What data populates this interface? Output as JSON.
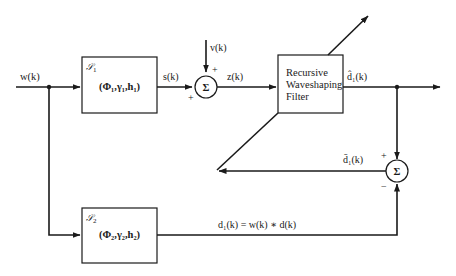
{
  "diagram": {
    "type": "block-diagram",
    "colors": {
      "line": "#1a1a1a",
      "background": "#ffffff"
    },
    "input": {
      "label": "w(k)"
    },
    "blocks": {
      "system1": {
        "symbol": "𝒮",
        "subscript": "1",
        "params": "(Φ₁,γ₁,h₁)"
      },
      "system2": {
        "caption": "Desired Signal",
        "symbol": "𝒮",
        "subscript": "2",
        "params": "(Φ₂,γ₂,h₂)"
      },
      "filter": {
        "line1": "Recursive",
        "line2": "Waveshaping",
        "line3": "Filter"
      }
    },
    "summers": {
      "top": {
        "glyph": "Σ",
        "sign_left": "+",
        "sign_top": "+"
      },
      "right": {
        "glyph": "Σ",
        "sign_top": "+",
        "sign_bottom": "−"
      }
    },
    "signals": {
      "s": "s(k)",
      "v": "v(k)",
      "z": "z(k)",
      "d_hat": "d̂₁(k)",
      "d_bar": "d̄₁(k)",
      "d_eq": "d₁(k)  =  w(k) ∗ d(k)"
    }
  }
}
